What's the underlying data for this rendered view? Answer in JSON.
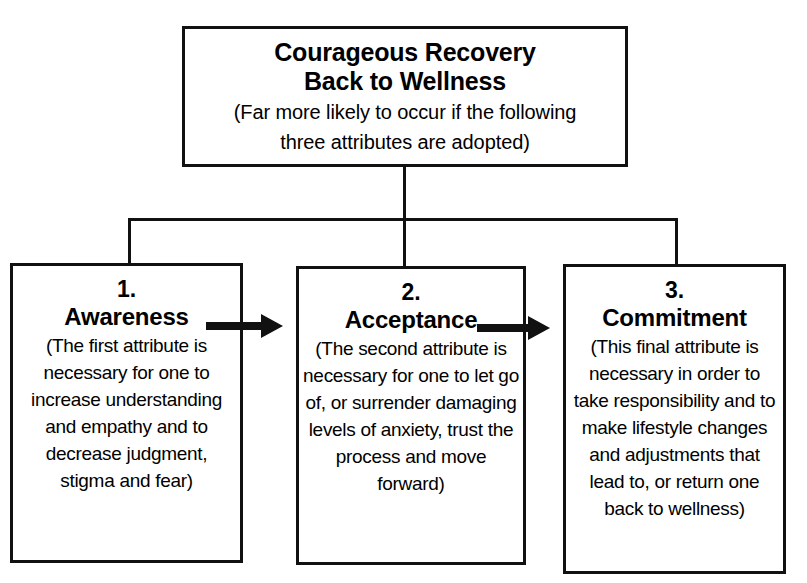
{
  "diagram": {
    "title_box": {
      "heading_line_1": "Courageous Recovery",
      "heading_line_2": "Back to Wellness",
      "subtitle_line_1": "(Far more likely to occur if the following",
      "subtitle_line_2": "three attributes are adopted)"
    },
    "attributes": [
      {
        "number": "1.",
        "name": "Awareness",
        "description": "(The first attribute is necessary for one to increase understanding and empathy and to decrease judgment, stigma and fear)"
      },
      {
        "number": "2.",
        "name": "Acceptance",
        "description": "(The second attribute is necessary for one to let go of, or surrender damaging levels of anxiety, trust the process and move forward)"
      },
      {
        "number": "3.",
        "name": "Commitment",
        "description": "(This final attribute is necessary in order to take responsibility and to make lifestyle changes and adjustments that lead to, or return one back to wellness)"
      }
    ],
    "colors": {
      "background": "#ffffff",
      "line": "#111111",
      "text": "#000000"
    }
  }
}
